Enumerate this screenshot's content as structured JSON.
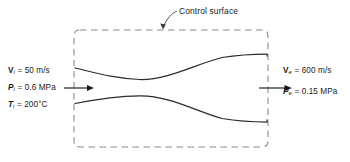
{
  "figure": {
    "control_surface_label": "Control surface",
    "inlet": {
      "velocity": "= 50 m/s",
      "velocity_symbol": "V",
      "velocity_subscript": "i",
      "pressure": "= 0.6 MPa",
      "pressure_symbol": "P",
      "pressure_subscript": "i",
      "temperature": "= 200°C",
      "temperature_symbol": "T",
      "temperature_subscript": "i"
    },
    "exit": {
      "velocity": "= 600 m/s",
      "velocity_symbol": "V",
      "velocity_subscript": "e",
      "pressure": "= 0.15 MPa",
      "pressure_symbol": "P",
      "pressure_subscript": "e"
    },
    "colors": {
      "line": "#1a1a1a",
      "dashed": "#8c8c8c",
      "background": "#ffffff"
    },
    "icons": {
      "inlet_flow_arrow": "arrow-right-icon",
      "exit_flow_arrow": "arrow-right-icon",
      "leader_arrow": "leader-arrow-icon"
    }
  }
}
